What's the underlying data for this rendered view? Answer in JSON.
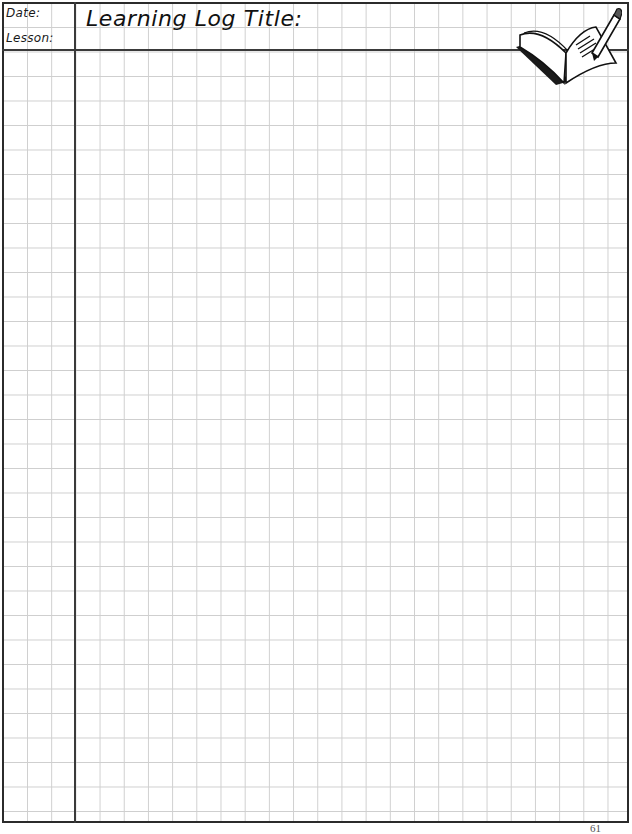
{
  "header": {
    "date_label": "Date:",
    "lesson_label": "Lesson:",
    "title_label": "Learning Log Title:"
  },
  "illustration": {
    "icon": "book-with-pencil-icon"
  },
  "footer": {
    "page_number": "61"
  },
  "colors": {
    "grid": "#cfcfcf",
    "border": "#2b2b2b",
    "text": "#111111"
  }
}
